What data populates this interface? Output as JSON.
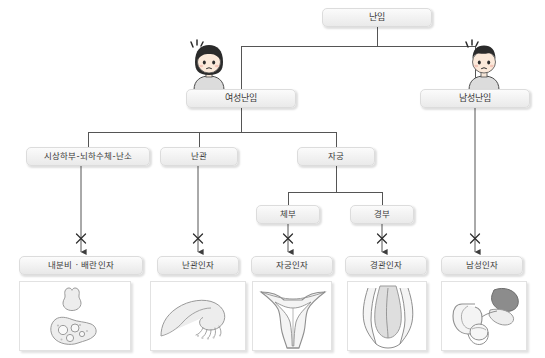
{
  "diagram": {
    "type": "tree",
    "title_node": {
      "id": "root",
      "label": "난임"
    },
    "nodes": [
      {
        "id": "root",
        "label": "난임",
        "level": 0,
        "x": 322,
        "y": 8,
        "w": 110,
        "h": 19
      },
      {
        "id": "female",
        "label": "여성난임",
        "level": 1,
        "x": 186,
        "y": 89,
        "w": 110,
        "h": 19
      },
      {
        "id": "male",
        "label": "남성난임",
        "level": 1,
        "x": 420,
        "y": 89,
        "w": 110,
        "h": 19
      },
      {
        "id": "hpo",
        "label": "시상하부-뇌하수체-난소",
        "level": 2,
        "x": 26,
        "y": 147,
        "w": 124,
        "h": 19
      },
      {
        "id": "tube",
        "label": "난관",
        "level": 2,
        "x": 160,
        "y": 147,
        "w": 78,
        "h": 19
      },
      {
        "id": "uterus",
        "label": "자궁",
        "level": 2,
        "x": 297,
        "y": 147,
        "w": 78,
        "h": 19
      },
      {
        "id": "corpus",
        "label": "체부",
        "level": 3,
        "x": 256,
        "y": 205,
        "w": 64,
        "h": 19
      },
      {
        "id": "cervix",
        "label": "경부",
        "level": 3,
        "x": 350,
        "y": 205,
        "w": 64,
        "h": 19
      }
    ],
    "leaf_nodes": [
      {
        "id": "endocrine",
        "label": "내분비 · 배란인자",
        "x": 19,
        "y": 256,
        "w": 124,
        "h": 19,
        "illustration": "pituitary-ovary-icon"
      },
      {
        "id": "tubal",
        "label": "난관인자",
        "x": 157,
        "y": 256,
        "w": 82,
        "h": 19,
        "illustration": "fallopian-tube-icon"
      },
      {
        "id": "uterine",
        "label": "자궁인자",
        "x": 251,
        "y": 256,
        "w": 82,
        "h": 19,
        "illustration": "uterus-icon"
      },
      {
        "id": "cervical",
        "label": "경관인자",
        "x": 345,
        "y": 256,
        "w": 82,
        "h": 19,
        "illustration": "cervix-icon"
      },
      {
        "id": "malefactor",
        "label": "남성인자",
        "x": 441,
        "y": 256,
        "w": 82,
        "h": 19,
        "illustration": "male-genital-icon"
      }
    ],
    "characters": [
      {
        "id": "female-character",
        "name": "female-patient-icon",
        "x": 186,
        "y": 38,
        "w": 46,
        "h": 52
      },
      {
        "id": "male-character",
        "name": "male-patient-icon",
        "x": 461,
        "y": 38,
        "w": 46,
        "h": 52
      }
    ],
    "arrow_markers": [
      {
        "for": "endocrine",
        "symbol": "x-blocked-arrow"
      },
      {
        "for": "tubal",
        "symbol": "x-blocked-arrow"
      },
      {
        "for": "uterine",
        "symbol": "x-blocked-arrow"
      },
      {
        "for": "cervical",
        "symbol": "x-blocked-arrow"
      },
      {
        "for": "malefactor",
        "symbol": "x-blocked-arrow"
      }
    ],
    "edges": [
      {
        "from": "root",
        "to": "female"
      },
      {
        "from": "root",
        "to": "male"
      },
      {
        "from": "female",
        "to": "hpo"
      },
      {
        "from": "female",
        "to": "tube"
      },
      {
        "from": "female",
        "to": "uterus"
      },
      {
        "from": "uterus",
        "to": "corpus"
      },
      {
        "from": "uterus",
        "to": "cervix"
      },
      {
        "from": "hpo",
        "to": "endocrine",
        "marker": "x-blocked-arrow"
      },
      {
        "from": "tube",
        "to": "tubal",
        "marker": "x-blocked-arrow"
      },
      {
        "from": "corpus",
        "to": "uterine",
        "marker": "x-blocked-arrow"
      },
      {
        "from": "cervix",
        "to": "cervical",
        "marker": "x-blocked-arrow"
      },
      {
        "from": "male",
        "to": "malefactor",
        "marker": "x-blocked-arrow"
      }
    ],
    "colors": {
      "background": "#ffffff",
      "node_fill": "#f2f2f2",
      "node_border": "#dcdcdc",
      "node_text": "#3a3a3a",
      "line": "#555555",
      "frame_border": "#e2e2e2",
      "illustration_stroke": "#9a9a9a",
      "illustration_fill": "#e3e3e3"
    }
  }
}
